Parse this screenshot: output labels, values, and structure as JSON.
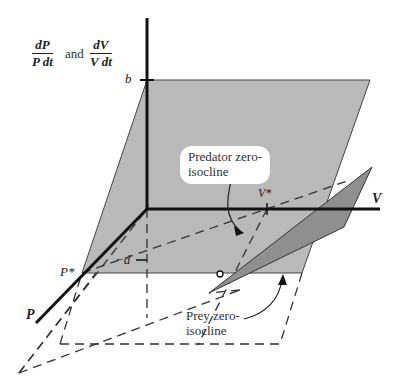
{
  "diagram": {
    "ylabel": {
      "term1": {
        "num": "dP",
        "den": "P dt"
      },
      "connector": "and",
      "term2": {
        "num": "dV",
        "den": "V dt"
      }
    },
    "axis_labels": {
      "vertical_tick": "b",
      "negative_tick": "−d",
      "v_axis": "V",
      "p_axis": "P",
      "v_star": "V*",
      "p_star": "P*"
    },
    "annotations": {
      "predator": [
        "Predator zero-",
        "isocline"
      ],
      "prey": [
        "Prey zero-",
        "isocline"
      ]
    },
    "colors": {
      "predator_plane": "#b8b8b8",
      "prey_plane": "#8e8e8e",
      "axis": "#111111",
      "dashed": "#333333",
      "background": "#ffffff"
    }
  }
}
